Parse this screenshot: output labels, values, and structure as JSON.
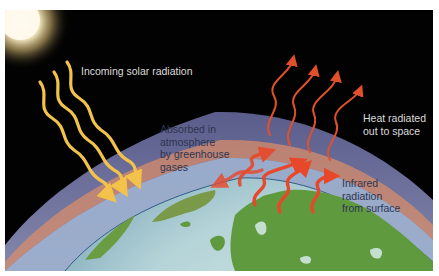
{
  "figure": {
    "colors": {
      "space": "#020202",
      "sun": "#fff6dc",
      "solar_arrows": "#f2c24a",
      "heat_arrows": "#e2502a",
      "atmosphere_outer": "#6d6f9a",
      "atmosphere_band": "#d88c6a",
      "ocean": "#b7d6d8",
      "land": "#5f9a3e"
    },
    "labels": {
      "incoming": "Incoming solar radiation",
      "absorbed": [
        "Absorbed in",
        "atmosphere",
        "by greenhouse",
        "gases"
      ],
      "heat_out": [
        "Heat radiated",
        "out to space"
      ],
      "infrared": [
        "Infrared",
        "radiation",
        "from surface"
      ]
    },
    "icons": {
      "sun": "sun-icon",
      "solar_arrow": "wavy-arrow-down-icon",
      "heat_arrow": "wavy-arrow-up-icon"
    }
  }
}
